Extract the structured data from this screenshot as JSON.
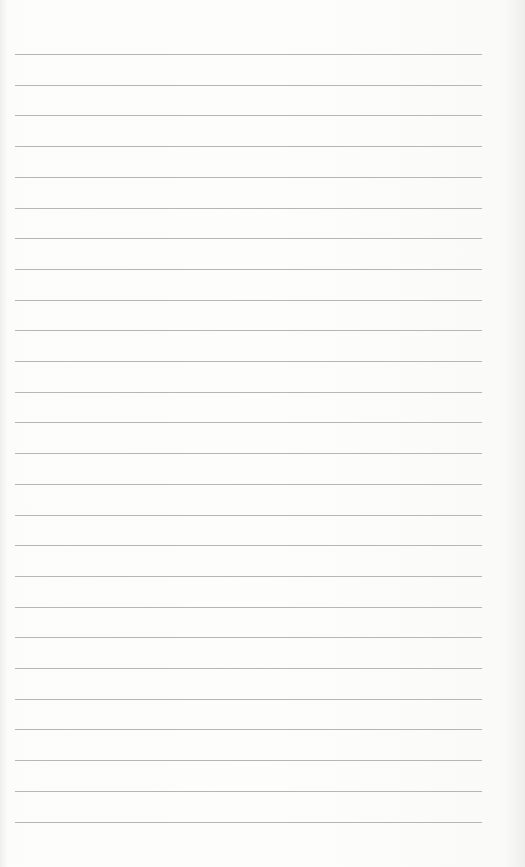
{
  "page": {
    "type": "lined-paper",
    "background_color": "#fbfbfa",
    "rule_color": "#a9a9a9",
    "rule_count": 26,
    "rule_start_y": 54,
    "rule_spacing": 30.7,
    "rule_left": 15,
    "rule_right": 482,
    "text": []
  }
}
